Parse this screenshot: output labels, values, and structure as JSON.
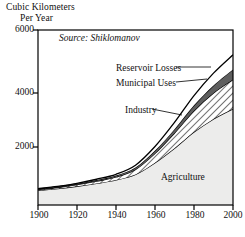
{
  "axis_titles": {
    "y_line1": "Cubic Kilometers",
    "y_line2": "Per Year"
  },
  "annotations": {
    "source": "Source: Shiklomanov"
  },
  "labels": {
    "reservoir": "Reservoir Losses",
    "municipal": "Municipal Uses",
    "industry": "Industry",
    "agriculture": "Agriculture"
  },
  "ticks": {
    "y": [
      "6000",
      "4000",
      "2000"
    ],
    "x": [
      "1900",
      "1920",
      "1940",
      "1960",
      "1980",
      "2000"
    ]
  },
  "colors": {
    "agriculture": "#ececeb",
    "industry_hatch": "#ffffff",
    "municipal": "#5e5e5e",
    "reservoir": "#ffffff",
    "line": "#000000",
    "frame": "#000000",
    "text": "#111111"
  },
  "chart_data": {
    "type": "area",
    "title": "",
    "subtitle": "",
    "xlabel": "",
    "ylabel": "Cubic Kilometers Per Year",
    "xlim": [
      1900,
      2000
    ],
    "ylim": [
      0,
      6000
    ],
    "grid": false,
    "legend": "inline-leader-lines",
    "stacked": true,
    "x": [
      1900,
      1910,
      1920,
      1930,
      1940,
      1950,
      1960,
      1970,
      1980,
      1990,
      2000
    ],
    "series": [
      {
        "name": "Agriculture",
        "fill": "#ececeb",
        "values": [
          500,
          560,
          640,
          740,
          860,
          1050,
          1450,
          1950,
          2500,
          2950,
          3300
        ]
      },
      {
        "name": "Industry",
        "fill": "hatch",
        "values": [
          30,
          40,
          55,
          75,
          100,
          170,
          320,
          520,
          730,
          890,
          1000
        ]
      },
      {
        "name": "Municipal Uses",
        "fill": "#5e5e5e",
        "values": [
          20,
          24,
          30,
          38,
          48,
          65,
          95,
          130,
          190,
          260,
          350
        ]
      },
      {
        "name": "Reservoir Losses",
        "fill": "#ffffff",
        "values": [
          10,
          14,
          20,
          30,
          45,
          80,
          140,
          230,
          330,
          420,
          500
        ]
      }
    ],
    "totals": [
      560,
      638,
      745,
      883,
      1053,
      1365,
      2005,
      2830,
      3750,
      4520,
      5150
    ]
  }
}
